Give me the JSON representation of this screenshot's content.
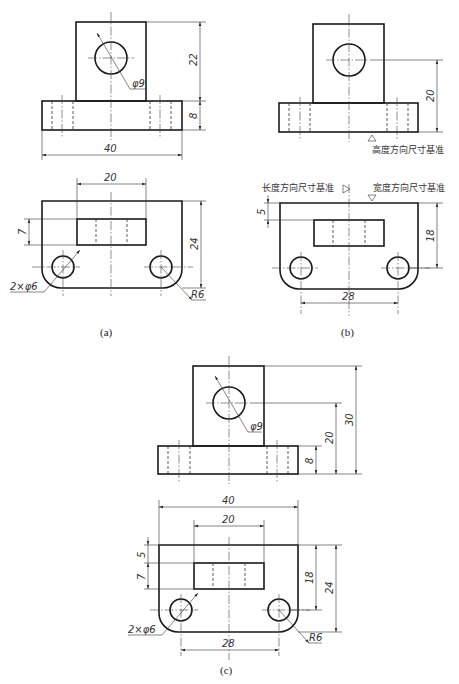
{
  "figures": [
    {
      "id": "a",
      "caption": "(a)",
      "front_view": {
        "dims": {
          "overall_width": "40",
          "upright_height": "22",
          "base_height": "8",
          "hole_dia": "φ9"
        }
      },
      "top_view": {
        "dims": {
          "slot_length": "20",
          "slot_width": "7",
          "overall_depth": "24",
          "holes": "2×φ6",
          "corner_radius": "R6"
        }
      }
    },
    {
      "id": "b",
      "caption": "(b)",
      "front_view": {
        "dims": {
          "hole_center_height": "20"
        },
        "datum_label": "高度方向尺寸基准"
      },
      "top_view": {
        "dims": {
          "slot_offset": "5",
          "hole_center_depth": "18",
          "hole_spacing": "28"
        },
        "length_datum_label": "长度方向尺寸基准",
        "width_datum_label": "宽度方向尺寸基准"
      }
    },
    {
      "id": "c",
      "caption": "(c)",
      "front_view": {
        "dims": {
          "hole_dia": "φ9",
          "base_height": "8",
          "hole_center_height": "20",
          "overall_height": "30"
        }
      },
      "top_view": {
        "dims": {
          "overall_width": "40",
          "slot_length": "20",
          "slot_offset": "5",
          "slot_width": "7",
          "hole_center_depth": "18",
          "overall_depth": "24",
          "holes": "2×φ6",
          "corner_radius": "R6",
          "hole_spacing": "28"
        }
      }
    }
  ]
}
